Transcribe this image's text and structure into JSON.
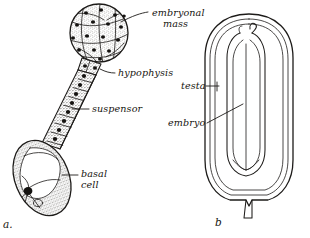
{
  "figure": {
    "background_color": "#ffffff",
    "ink_color": "#1d1b19",
    "panels": [
      {
        "caption": "a.",
        "caption_x": 3,
        "caption_y": 228,
        "description": "Developing embryo with embryonal mass, hypophysis, suspensor and basal cell"
      },
      {
        "caption": "b",
        "caption_x": 215,
        "caption_y": 226,
        "description": "Seed in longitudinal section showing testa and embryo"
      }
    ]
  },
  "labels": {
    "embryonal_mass": {
      "line1": "embryonal",
      "line2": "mass",
      "x": 152,
      "y": 16,
      "y2": 27
    },
    "hypophysis": {
      "text": "hypophysis",
      "x": 118,
      "y": 76
    },
    "suspensor": {
      "text": "suspensor",
      "x": 92,
      "y": 112
    },
    "basal_cell": {
      "line1": "basal",
      "line2": "cell",
      "x": 81,
      "y": 177,
      "y2": 188
    },
    "testa": {
      "text": "testa",
      "x": 181,
      "y": 89
    },
    "embryo": {
      "text": "embryo",
      "x": 168,
      "y": 126
    }
  },
  "diagram_data": {
    "type": "botanical-line-drawing",
    "panel_a": {
      "embryonal_mass": {
        "shape": "stippled sphere",
        "center_x": 99,
        "center_y": 33,
        "radius": 29,
        "nuclei_count": 16,
        "has_stipple": true,
        "has_division_walls": true
      },
      "hypophysis": {
        "shape": "small cell cluster at sphere base",
        "x": 86,
        "y": 64
      },
      "suspensor": {
        "shape": "diagonal chain of rectangular cells",
        "cell_count": 9,
        "from_x": 86,
        "from_y": 64,
        "to_x": 52,
        "to_y": 142
      },
      "basal_cell": {
        "shape": "large stippled ovoid with vacuole",
        "center_x": 42,
        "center_y": 178,
        "width": 54,
        "height": 78,
        "rotation_deg": -22,
        "has_nucleus": true
      }
    },
    "panel_b": {
      "seed": {
        "shape": "longitudinal section, rounded top, pointed micropyle base",
        "center_x": 250,
        "top_y": 14,
        "bottom_y": 200,
        "width": 86,
        "coat_layers": 3
      },
      "embryo": {
        "shape": "elongate inner body with hooked plumule",
        "top_y": 30,
        "bottom_y": 168,
        "has_plumule_hook": true
      },
      "micropyle": {
        "shape": "short basal projection",
        "x": 249,
        "y": 200
      }
    }
  }
}
